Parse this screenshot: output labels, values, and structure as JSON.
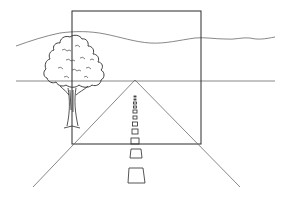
{
  "illustration": {
    "subject": "one-point perspective drawing of a road to the horizon",
    "colors": {
      "background": "#ffffff",
      "ink": "#2a2a2a",
      "light_ink": "#6a6a6a"
    },
    "frame": {
      "x": 72,
      "y": 11,
      "width": 129,
      "height": 133
    },
    "horizon_y": 81,
    "vanishing_point": {
      "x": 135,
      "y": 80
    },
    "road_bottom_left": {
      "x": 33,
      "y": 187
    },
    "road_bottom_right": {
      "x": 240,
      "y": 187
    },
    "dashes": [
      {
        "x": 134,
        "y": 96,
        "w": 2,
        "h": 1
      },
      {
        "x": 134,
        "y": 99,
        "w": 2,
        "h": 1
      },
      {
        "x": 133.5,
        "y": 102,
        "w": 3,
        "h": 2
      },
      {
        "x": 133.5,
        "y": 106,
        "w": 3,
        "h": 2
      },
      {
        "x": 133,
        "y": 110,
        "w": 4,
        "h": 3
      },
      {
        "x": 133,
        "y": 116,
        "w": 4,
        "h": 3
      },
      {
        "x": 132.5,
        "y": 122,
        "w": 5,
        "h": 4
      },
      {
        "x": 132,
        "y": 129,
        "w": 6,
        "h": 5
      },
      {
        "x": 131,
        "y": 138,
        "w": 8,
        "h": 6
      },
      {
        "x": 130,
        "y": 149,
        "w": 11,
        "h": 9
      },
      {
        "x": 128,
        "y": 168,
        "w": 16,
        "h": 15
      }
    ]
  }
}
